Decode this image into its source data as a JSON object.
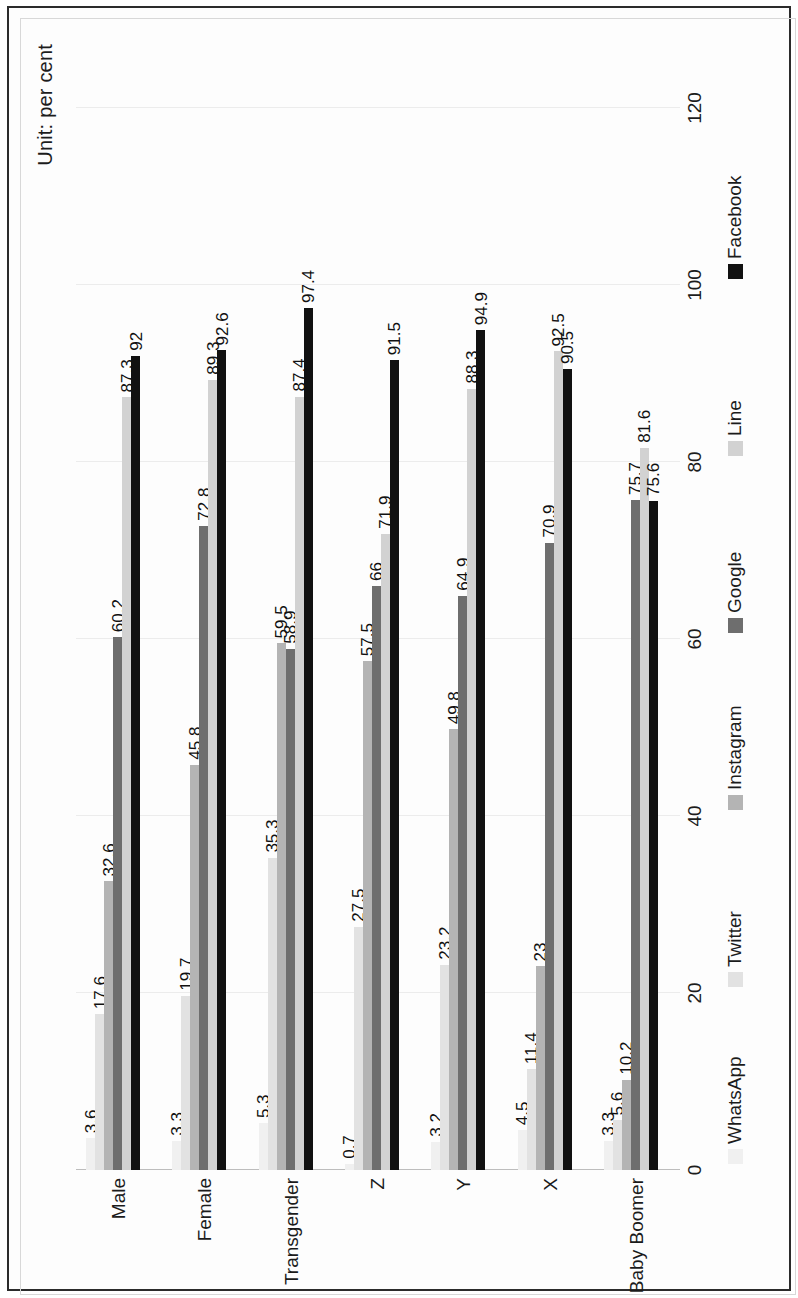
{
  "figure": {
    "unit_note": "Unit: per cent"
  },
  "chart_data": {
    "type": "bar",
    "orientation": "horizontal",
    "title": "",
    "subtitle": "",
    "xlabel": "",
    "ylabel": "",
    "unit_note": "Unit: per cent",
    "xlim": [
      0,
      120
    ],
    "xticks": [
      0,
      20,
      40,
      60,
      80,
      100,
      120
    ],
    "tick_labels": [
      "0",
      "20",
      "40",
      "60",
      "80",
      "100",
      "120"
    ],
    "grid": true,
    "legend_position": "bottom",
    "categories": [
      "Male",
      "Female",
      "Transgender",
      "Z",
      "Y",
      "X",
      "Baby Boomer"
    ],
    "series": [
      {
        "name": "WhatsApp",
        "color": "#f0f0f0",
        "values": [
          3.6,
          3.3,
          5.3,
          0.7,
          3.2,
          4.5,
          3.3
        ],
        "labels": [
          "3.6",
          "3.3",
          "5.3",
          "0.7",
          "3.2",
          "4.5",
          "3.3"
        ]
      },
      {
        "name": "Twitter",
        "color": "#e2e2e2",
        "values": [
          17.6,
          19.7,
          35.3,
          27.5,
          23.2,
          11.4,
          5.6
        ],
        "labels": [
          "17.6",
          "19.7",
          "35.3",
          "27.5",
          "23.2",
          "11.4",
          "5.6"
        ]
      },
      {
        "name": "Instagram",
        "color": "#b4b4b4",
        "values": [
          32.6,
          45.8,
          59.5,
          57.5,
          49.8,
          23,
          10.2
        ],
        "labels": [
          "32.6",
          "45.8",
          "59.5",
          "57.5",
          "49.8",
          "23",
          "10.2"
        ]
      },
      {
        "name": "Google",
        "color": "#6e6e6e",
        "values": [
          60.2,
          72.8,
          58.9,
          66,
          64.9,
          70.9,
          75.7
        ],
        "labels": [
          "60.2",
          "72.8",
          "58.9",
          "66",
          "64.9",
          "70.9",
          "75.7"
        ]
      },
      {
        "name": "Line",
        "color": "#d2d2d2",
        "values": [
          87.3,
          89.3,
          87.4,
          71.9,
          88.3,
          92.5,
          81.6
        ],
        "labels": [
          "87.3",
          "89.3",
          "87.4",
          "71.9",
          "88.3",
          "92.5",
          "81.6"
        ]
      },
      {
        "name": "Facebook",
        "color": "#111111",
        "values": [
          92,
          92.6,
          97.4,
          91.5,
          94.9,
          90.5,
          75.6
        ],
        "labels": [
          "92",
          "92.6",
          "97.4",
          "91.5",
          "94.9",
          "90.5",
          "75.6"
        ]
      }
    ]
  }
}
